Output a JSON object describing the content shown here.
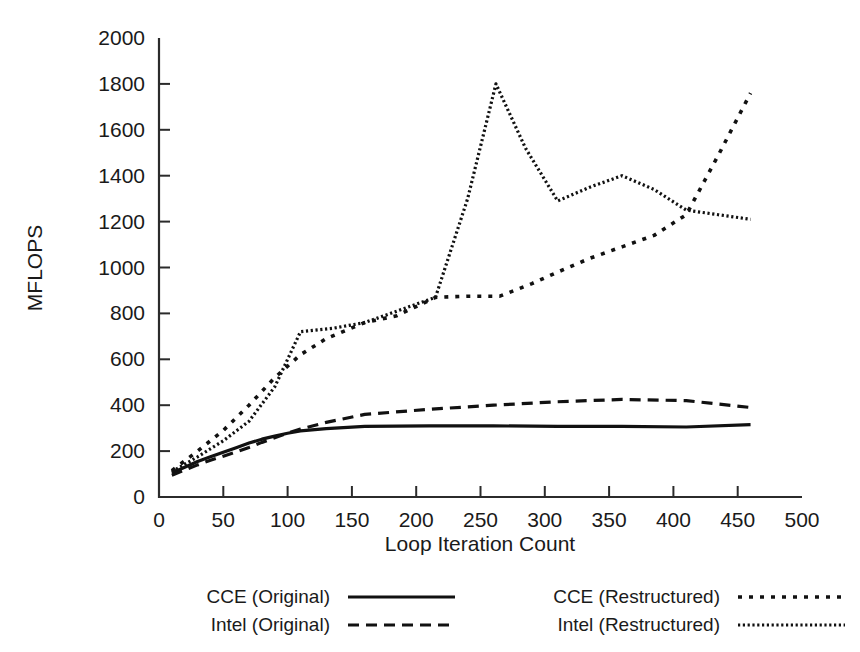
{
  "chart_data": {
    "type": "line",
    "title": "",
    "xlabel": "Loop Iteration Count",
    "ylabel": "MFLOPS",
    "xlim": [
      0,
      500
    ],
    "ylim": [
      0,
      2000
    ],
    "xticks": [
      0,
      50,
      100,
      150,
      200,
      250,
      300,
      350,
      400,
      450,
      500
    ],
    "yticks": [
      0,
      200,
      400,
      600,
      800,
      1000,
      1200,
      1400,
      1600,
      1800,
      2000
    ],
    "grid": false,
    "legend_position": "below-axes",
    "series": [
      {
        "name": "CCE (Original)",
        "style": "solid",
        "x": [
          10,
          20,
          30,
          40,
          50,
          60,
          70,
          80,
          90,
          100,
          110,
          130,
          160,
          210,
          260,
          310,
          360,
          410,
          460
        ],
        "y": [
          105,
          130,
          155,
          175,
          195,
          215,
          235,
          252,
          265,
          278,
          288,
          298,
          308,
          310,
          310,
          308,
          308,
          305,
          315
        ]
      },
      {
        "name": "Intel (Original)",
        "style": "dashed",
        "x": [
          10,
          20,
          30,
          40,
          50,
          60,
          70,
          80,
          90,
          100,
          110,
          130,
          160,
          210,
          260,
          310,
          360,
          410,
          460
        ],
        "y": [
          95,
          118,
          140,
          160,
          178,
          196,
          216,
          238,
          258,
          278,
          296,
          325,
          360,
          382,
          400,
          415,
          425,
          420,
          390
        ]
      },
      {
        "name": "CCE (Restructured)",
        "style": "dotted-coarse",
        "x": [
          10,
          30,
          50,
          70,
          90,
          110,
          130,
          160,
          185,
          215,
          240,
          265,
          290,
          310,
          335,
          360,
          385,
          410,
          435,
          460
        ],
        "y": [
          115,
          200,
          290,
          400,
          520,
          620,
          690,
          760,
          790,
          870,
          875,
          875,
          930,
          980,
          1040,
          1090,
          1140,
          1230,
          1490,
          1760
        ]
      },
      {
        "name": "Intel (Restructured)",
        "style": "dotted-fine",
        "x": [
          10,
          30,
          50,
          70,
          90,
          110,
          135,
          160,
          185,
          215,
          240,
          262,
          285,
          310,
          335,
          360,
          385,
          410,
          435,
          460
        ],
        "y": [
          110,
          175,
          245,
          330,
          480,
          720,
          735,
          760,
          810,
          870,
          1300,
          1800,
          1520,
          1290,
          1350,
          1400,
          1340,
          1250,
          1230,
          1210
        ]
      }
    ]
  },
  "legend": {
    "items": [
      {
        "label": "CCE (Original)",
        "style": "solid"
      },
      {
        "label": "Intel (Original)",
        "style": "dashed"
      },
      {
        "label": "CCE (Restructured)",
        "style": "dotted-coarse"
      },
      {
        "label": "Intel (Restructured)",
        "style": "dotted-fine"
      }
    ]
  },
  "colors": {
    "ink": "#111111",
    "axis": "#2b2b2b",
    "background": "#ffffff"
  }
}
